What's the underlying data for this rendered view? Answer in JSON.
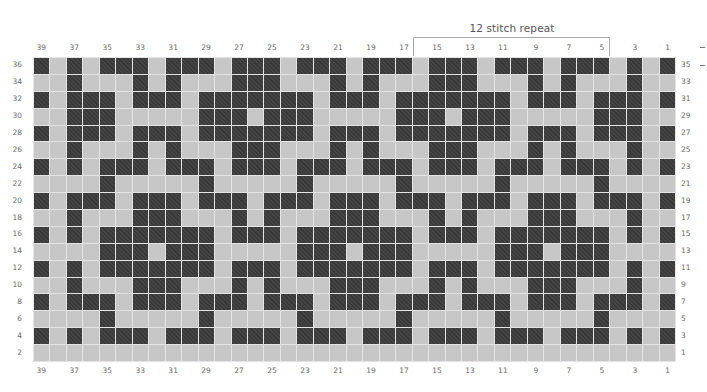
{
  "title": "12 stitch repeat",
  "repeat": {
    "from_col": 16,
    "to_col": 5
  },
  "colors": {
    "dark": "#3a3a3a",
    "light": "#c7c7c7",
    "gridline": "#e4e4e4",
    "bracket": "#aaaaaa"
  },
  "columns": 39,
  "rows": 18,
  "col_labels": [
    "39",
    "",
    "37",
    "",
    "35",
    "",
    "33",
    "",
    "31",
    "",
    "29",
    "",
    "27",
    "",
    "25",
    "",
    "23",
    "",
    "21",
    "",
    "19",
    "",
    "17",
    "",
    "15",
    "",
    "13",
    "",
    "11",
    "",
    "9",
    "",
    "7",
    "",
    "5",
    "",
    "3",
    "",
    "1"
  ],
  "row_labels_left": [
    "36",
    "34",
    "32",
    "30",
    "28",
    "26",
    "24",
    "22",
    "20",
    "18",
    "16",
    "14",
    "12",
    "10",
    "8",
    "6",
    "4",
    "2"
  ],
  "row_labels_right": [
    "35",
    "33",
    "31",
    "29",
    "27",
    "25",
    "23",
    "21",
    "19",
    "17",
    "15",
    "13",
    "11",
    "9",
    "7",
    "5",
    "3",
    "1"
  ],
  "grid": [
    "101011101110111011101110111011101110101",
    "001000101000111000101000111000101000100",
    "101110111011111110111011111110111011101",
    "001110000011101110000011101110000011100",
    "101110111011111110111011111110111011101",
    "001000101000111000101000111000101000100",
    "101011101110111011101110111011101110101",
    "000010000010000010000010000010000010000",
    "101110111011101110111011101110111011101",
    "001000111000101000111000101000111000100",
    "101011111110111011111110111011111110101",
    "000011101110000011101110000011101110000",
    "101011111110111011111110111011111110101",
    "001000111000101000111000101000111000100",
    "101110111011101110111011101110111011101",
    "000010000010000010000010000010000010000",
    "101011101110111011101110111011101110101",
    "000000000000000000000000000000000000000"
  ],
  "side_marks": [
    "-",
    "-"
  ]
}
